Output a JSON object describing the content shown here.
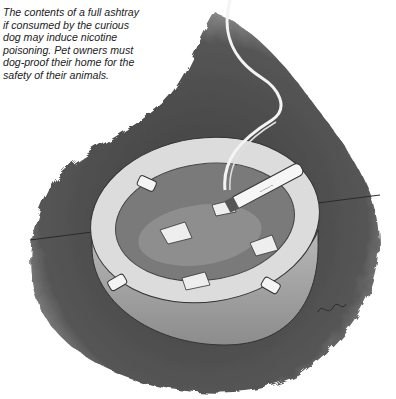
{
  "caption": {
    "lines": [
      "The contents of a full ashtray",
      "if consumed by the curious",
      "dog may induce nicotine",
      "poisoning. Pet owners must",
      "dog-proof their home for the",
      "safety of their animals."
    ]
  },
  "illustration": {
    "subject": "ashtray with cigarette butts and a smoking cigarette",
    "colors": {
      "background": "#ffffff",
      "shadow": "#4a4a4a",
      "ashtray": "#c8c8c8",
      "rim": "#e4e4e4",
      "ash": "#6a6a6a"
    }
  }
}
